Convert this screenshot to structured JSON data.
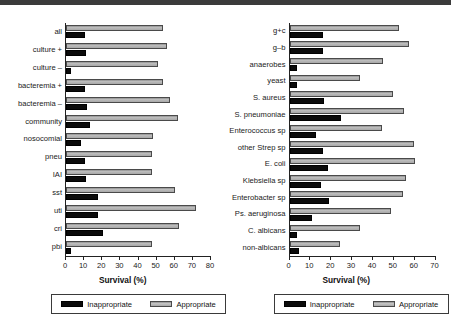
{
  "figure": {
    "legend": {
      "inappropriate_label": "Inappropriate",
      "appropriate_label": "Appropriate"
    },
    "colors": {
      "inappropriate": "#0b0b0b",
      "appropriate": "#b4b4b4",
      "axis": "#222222"
    }
  },
  "chart_data": [
    {
      "id": "left",
      "type": "bar",
      "orientation": "horizontal",
      "title": "",
      "xlabel": "Survival (%)",
      "ylabel": "",
      "xlim": [
        0,
        80
      ],
      "xticks": [
        0,
        10,
        20,
        30,
        40,
        50,
        60,
        70,
        80
      ],
      "grid": false,
      "legend_position": "bottom",
      "categories": [
        "all",
        "culture +",
        "culture –",
        "bacteremia +",
        "bacteremia –",
        "community",
        "nosocomial",
        "pneu",
        "IAI",
        "sst",
        "uti",
        "cri",
        "pbi"
      ],
      "series": [
        {
          "name": "Inappropriate",
          "values": [
            10.5,
            11.0,
            3.0,
            10.5,
            11.5,
            13.5,
            8.5,
            10.5,
            11.0,
            17.5,
            18.0,
            20.5,
            2.5
          ]
        },
        {
          "name": "Appropriate",
          "values": [
            54.0,
            56.0,
            51.0,
            54.0,
            58.0,
            62.0,
            48.5,
            48.0,
            48.0,
            60.5,
            72.0,
            63.0,
            47.5
          ]
        }
      ]
    },
    {
      "id": "right",
      "type": "bar",
      "orientation": "horizontal",
      "title": "",
      "xlabel": "Survival (%)",
      "ylabel": "",
      "xlim": [
        0,
        70
      ],
      "xticks": [
        0,
        10,
        20,
        30,
        40,
        50,
        60,
        70
      ],
      "grid": false,
      "legend_position": "bottom",
      "categories": [
        "g+c",
        "g–b",
        "anaerobes",
        "yeast",
        "S. aureus",
        "S. pneumoniae",
        "Enterococcus sp",
        "other Strep sp",
        "E. coli",
        "Klebsiella sp",
        "Enterobacter sp",
        "Ps. aeruginosa",
        "C. albicans",
        "non-albicans"
      ],
      "series": [
        {
          "name": "Inappropriate",
          "values": [
            16.0,
            16.0,
            3.5,
            3.5,
            16.5,
            25.0,
            13.0,
            16.0,
            18.5,
            15.0,
            19.0,
            11.0,
            3.5,
            4.5
          ]
        },
        {
          "name": "Appropriate",
          "values": [
            53.0,
            57.5,
            45.0,
            34.0,
            50.0,
            55.5,
            44.5,
            60.0,
            60.5,
            56.0,
            55.0,
            49.0,
            34.0,
            24.5
          ]
        }
      ]
    }
  ]
}
